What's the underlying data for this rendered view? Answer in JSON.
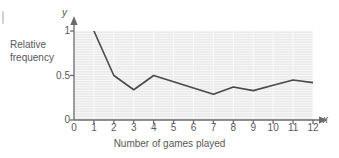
{
  "chart_data": {
    "type": "line",
    "title": "",
    "subtitle": "",
    "caption": "Number of games played",
    "xlabel": "Number of games played",
    "ylabel": "Relative frequency",
    "ylabel_line1": "Relative",
    "ylabel_line2": "frequency",
    "x_axis_symbol": "x",
    "y_axis_symbol": "y",
    "x": [
      1,
      2,
      3,
      4,
      5,
      6,
      7,
      8,
      9,
      10,
      11,
      12
    ],
    "values": [
      1.0,
      0.5,
      0.34,
      0.5,
      0.43,
      0.36,
      0.29,
      0.37,
      0.33,
      0.39,
      0.45,
      0.42
    ],
    "xlim": [
      0,
      12
    ],
    "ylim": [
      0,
      1
    ],
    "xticks": [
      "0",
      "1",
      "2",
      "3",
      "4",
      "5",
      "6",
      "7",
      "8",
      "9",
      "10",
      "11",
      "12"
    ],
    "yticks": [
      "0",
      "0.5",
      "1"
    ],
    "ytick_values": [
      0,
      0.5,
      1
    ],
    "grid": true,
    "grid_orientation": "both",
    "legend": "none",
    "line_color": "#4a4a4c",
    "plot_background": "#e9e9e9",
    "grid_color": "#fafafa",
    "axis_color": "#6b6b6d",
    "text_color": "#58585a"
  }
}
